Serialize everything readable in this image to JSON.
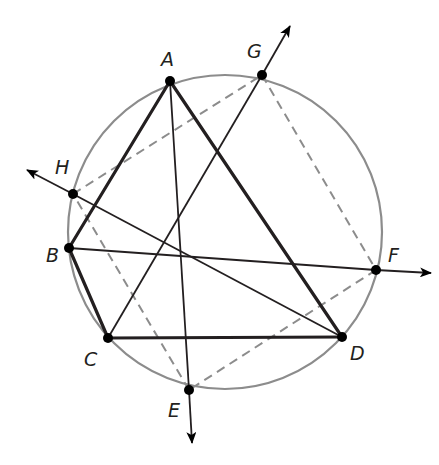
{
  "diagram": {
    "colors": {
      "circle": "#8c8c8c",
      "dashed": "#8c8c8c",
      "line": "#231f20",
      "point": "#000000",
      "label": "#231f20"
    },
    "circle": {
      "cx": 225,
      "cy": 232,
      "r": 157
    },
    "points": {
      "A": {
        "x": 170,
        "y": 81
      },
      "G": {
        "x": 262,
        "y": 75
      },
      "H": {
        "x": 73,
        "y": 194
      },
      "B": {
        "x": 69,
        "y": 248
      },
      "F": {
        "x": 376,
        "y": 270
      },
      "C": {
        "x": 108,
        "y": 338
      },
      "D": {
        "x": 342,
        "y": 337
      },
      "E": {
        "x": 189,
        "y": 390
      }
    },
    "labels": {
      "A": {
        "text": "A",
        "x": 161,
        "y": 66
      },
      "G": {
        "text": "G",
        "x": 247,
        "y": 58
      },
      "H": {
        "text": "H",
        "x": 55,
        "y": 174
      },
      "B": {
        "text": "B",
        "x": 46,
        "y": 262
      },
      "F": {
        "text": "F",
        "x": 388,
        "y": 262
      },
      "C": {
        "text": "C",
        "x": 84,
        "y": 366
      },
      "D": {
        "text": "D",
        "x": 350,
        "y": 360
      },
      "E": {
        "text": "E",
        "x": 168,
        "y": 417
      }
    },
    "thick_segments": [
      [
        "A",
        "B"
      ],
      [
        "B",
        "C"
      ],
      [
        "C",
        "D"
      ],
      [
        "D",
        "A"
      ]
    ],
    "thin_segments": [
      [
        "A",
        "E"
      ],
      [
        "B",
        "F"
      ],
      [
        "H",
        "D"
      ],
      [
        "C",
        "G"
      ]
    ],
    "dashed_segments": [
      [
        "H",
        "G"
      ],
      [
        "G",
        "F"
      ],
      [
        "F",
        "E"
      ],
      [
        "E",
        "H"
      ]
    ],
    "arrows": [
      {
        "from": "C",
        "to": "G",
        "tip": {
          "x": 290,
          "y": 26
        }
      },
      {
        "from": "D",
        "to": "H",
        "tip": {
          "x": 27,
          "y": 170
        }
      },
      {
        "from": "B",
        "to": "F",
        "tip": {
          "x": 431,
          "y": 273
        }
      },
      {
        "from": "A",
        "to": "E",
        "tip": {
          "x": 192,
          "y": 443
        }
      }
    ]
  }
}
